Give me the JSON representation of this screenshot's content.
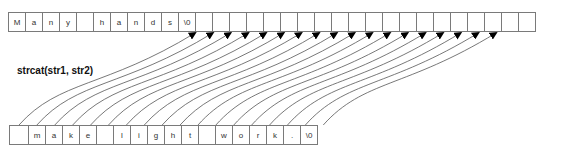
{
  "diagram": {
    "title": "strcat(str1, str2)",
    "str1": {
      "cells": [
        "M",
        "a",
        "n",
        "y",
        " ",
        "h",
        "a",
        "n",
        "d",
        "s",
        "\\0",
        "",
        "",
        "",
        "",
        "",
        "",
        "",
        "",
        "",
        "",
        "",
        "",
        "",
        "",
        "",
        "",
        "",
        "",
        "",
        ""
      ]
    },
    "str2": {
      "cells": [
        "",
        "m",
        "a",
        "k",
        "e",
        " ",
        "l",
        "i",
        "g",
        "h",
        "t",
        " ",
        "w",
        "o",
        "r",
        "k",
        ".",
        "\\0"
      ]
    },
    "arrows": {
      "count": 18,
      "from": "str2 cells 0-17",
      "to": "str1 cells 10-27",
      "color": "#000000",
      "line_color": "#555555"
    }
  }
}
